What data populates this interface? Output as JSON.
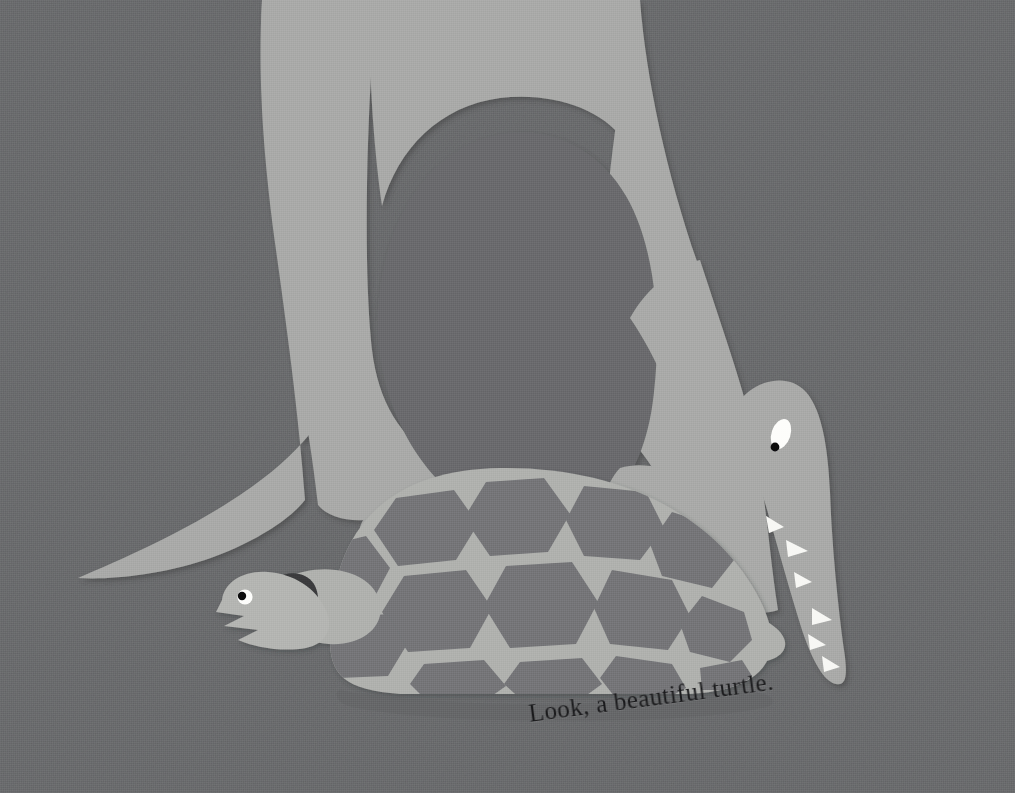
{
  "page": {
    "kind": "picture-book-illustration",
    "technique": "cut-paper collage",
    "width": 1015,
    "height": 793,
    "caption": "Look, a beautiful turtle.",
    "caption_rotation_deg": -7.5
  },
  "palette": {
    "background": "#6d6e70",
    "background_shadow": "#636466",
    "dinosaur_body": "#a9aaa8",
    "dinosaur_body_shadow": "#9a9b99",
    "turtle_body": "#b0b1ae",
    "turtle_shell_plate": "#747578",
    "turtle_head": "#b4b5b2",
    "eye_white": "#fdfdfb",
    "eye_pupil": "#0d0d0f",
    "tooth_white": "#f7f7f4",
    "caption_ink": "#1a1a1c"
  },
  "scene": {
    "title": "Dinosaur arching over a turtle",
    "figures": [
      {
        "name": "dinosaur",
        "label": "Dinosaur",
        "color": "#a9aaa8",
        "parts": [
          {
            "name": "body-arch",
            "label": "Body and legs forming an arch"
          },
          {
            "name": "tail",
            "label": "Tail tapering to the left"
          },
          {
            "name": "neck",
            "label": "Neck curving down on the right"
          },
          {
            "name": "head",
            "label": "Head with long snout"
          },
          {
            "name": "front-claw-left",
            "label": "Left clawed hand"
          },
          {
            "name": "front-claw-right",
            "label": "Right clawed hand"
          }
        ],
        "eye": {
          "name": "dinosaur-eye",
          "shape": "oval",
          "white": "#fdfdfb",
          "pupil": "#0d0d0f"
        },
        "teeth_count": 6,
        "tooth_color": "#f7f7f4"
      },
      {
        "name": "turtle",
        "label": "Turtle",
        "color": "#b0b1ae",
        "parts": [
          {
            "name": "shell",
            "label": "Domed shell with hexagonal plates"
          },
          {
            "name": "head",
            "label": "Head with open beak"
          },
          {
            "name": "front-flipper",
            "label": "Front flipper"
          },
          {
            "name": "rear-flipper",
            "label": "Rear flipper"
          }
        ],
        "eye": {
          "name": "turtle-eye",
          "shape": "circle",
          "white": "#fdfdfb",
          "pupil": "#0d0d0f"
        },
        "shell_plate_count": 14,
        "shell_plate_color": "#747578"
      }
    ]
  }
}
